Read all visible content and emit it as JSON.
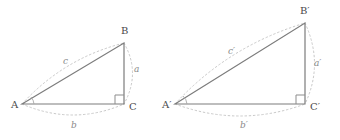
{
  "figure": {
    "stroke_color": "#7c7c7c",
    "dotted_color": "#c9c9c9",
    "label_color": "#4a4a4a",
    "side_label_color": "#8a8a8a",
    "background": "#ffffff"
  },
  "triangles": [
    {
      "id": "triangle-abc",
      "name": "ABC",
      "vertices": [
        {
          "key": "A",
          "label": "A",
          "x": 22,
          "y": 104,
          "label_x": 11,
          "label_y": 108
        },
        {
          "key": "B",
          "label": "B",
          "x": 124,
          "y": 43,
          "label_x": 121,
          "label_y": 34
        },
        {
          "key": "C",
          "label": "C",
          "x": 124,
          "y": 104,
          "label_x": 129,
          "label_y": 110
        }
      ],
      "sides": [
        {
          "key": "a",
          "label": "a",
          "from": "B",
          "to": "C",
          "label_x": 134,
          "label_y": 72
        },
        {
          "key": "b",
          "label": "b",
          "from": "A",
          "to": "C",
          "label_x": 71,
          "label_y": 128
        },
        {
          "key": "c",
          "label": "c",
          "from": "A",
          "to": "B",
          "label_x": 63,
          "label_y": 64
        }
      ],
      "right_angle_at": "C"
    },
    {
      "id": "triangle-abc-prime",
      "name": "A'B'C'",
      "vertices": [
        {
          "key": "A'",
          "label": "A′",
          "x": 175,
          "y": 104,
          "label_x": 162,
          "label_y": 108
        },
        {
          "key": "B'",
          "label": "B′",
          "x": 305,
          "y": 23,
          "label_x": 300,
          "label_y": 14
        },
        {
          "key": "C'",
          "label": "C′",
          "x": 305,
          "y": 104,
          "label_x": 310,
          "label_y": 110
        }
      ],
      "sides": [
        {
          "key": "a'",
          "label": "a′",
          "from": "B'",
          "to": "C'",
          "label_x": 314,
          "label_y": 66
        },
        {
          "key": "b'",
          "label": "b′",
          "from": "A'",
          "to": "C'",
          "label_x": 240,
          "label_y": 128
        },
        {
          "key": "c'",
          "label": "c′",
          "from": "A'",
          "to": "B'",
          "label_x": 228,
          "label_y": 54
        }
      ],
      "right_angle_at": "C'"
    }
  ]
}
